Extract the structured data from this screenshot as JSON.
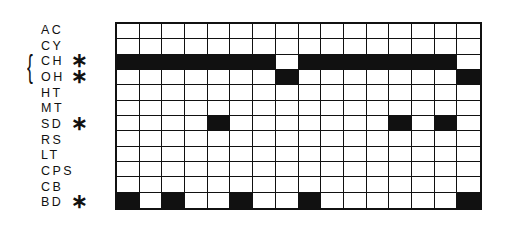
{
  "diagram": {
    "columns": 16,
    "fill_color": "#111111",
    "empty_color": "#ffffff",
    "brace_rows": [
      "CH",
      "OH"
    ],
    "brace_glyph": "{",
    "asterisk_glyph": "∗",
    "rows": [
      {
        "label": "AC",
        "asterisk": false,
        "filled": []
      },
      {
        "label": "CY",
        "asterisk": false,
        "filled": []
      },
      {
        "label": "CH",
        "asterisk": true,
        "filled": [
          0,
          1,
          2,
          3,
          4,
          5,
          6,
          8,
          9,
          10,
          11,
          12,
          13,
          14
        ]
      },
      {
        "label": "OH",
        "asterisk": true,
        "filled": [
          7,
          15
        ]
      },
      {
        "label": "HT",
        "asterisk": false,
        "filled": []
      },
      {
        "label": "MT",
        "asterisk": false,
        "filled": []
      },
      {
        "label": "SD",
        "asterisk": true,
        "filled": [
          4,
          12,
          14
        ]
      },
      {
        "label": "RS",
        "asterisk": false,
        "filled": []
      },
      {
        "label": "LT",
        "asterisk": false,
        "filled": []
      },
      {
        "label": "CPS",
        "asterisk": false,
        "filled": []
      },
      {
        "label": "CB",
        "asterisk": false,
        "filled": []
      },
      {
        "label": "BD",
        "asterisk": true,
        "filled": [
          0,
          2,
          5,
          8,
          15
        ]
      }
    ]
  }
}
